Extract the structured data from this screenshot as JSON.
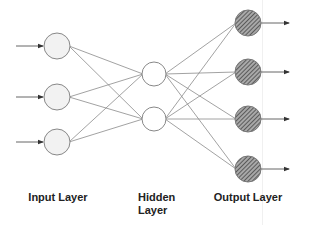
{
  "diagram": {
    "type": "neural-network",
    "colors": {
      "edge": "#8a8a8a",
      "node_stroke": "#888888",
      "input_fill": "#f2f2f2",
      "hidden_fill": "#ffffff",
      "output_fill": "#9a9a9a",
      "output_hatch": "#444444",
      "text": "#222222"
    },
    "layers": [
      {
        "name": "input",
        "label": "Input Layer",
        "nodes": [
          {
            "x": 57,
            "y": 46
          },
          {
            "x": 57,
            "y": 97
          },
          {
            "x": 57,
            "y": 142
          }
        ],
        "style": "light-fill"
      },
      {
        "name": "hidden",
        "label_line1": "Hidden",
        "label_line2": "Layer",
        "nodes": [
          {
            "x": 154,
            "y": 74
          },
          {
            "x": 154,
            "y": 119
          }
        ],
        "style": "empty"
      },
      {
        "name": "output",
        "label": "Output Layer",
        "nodes": [
          {
            "x": 248,
            "y": 23
          },
          {
            "x": 248,
            "y": 72
          },
          {
            "x": 248,
            "y": 119
          },
          {
            "x": 248,
            "y": 169
          }
        ],
        "style": "hatched"
      }
    ],
    "connections": "fully-connected",
    "input_arrows": "arrows into each input node from left",
    "output_arrows": "arrows out of each output node to right"
  },
  "labels": {
    "input": "Input Layer",
    "hidden_line1": "Hidden",
    "hidden_line2": "Layer",
    "output": "Output Layer"
  }
}
